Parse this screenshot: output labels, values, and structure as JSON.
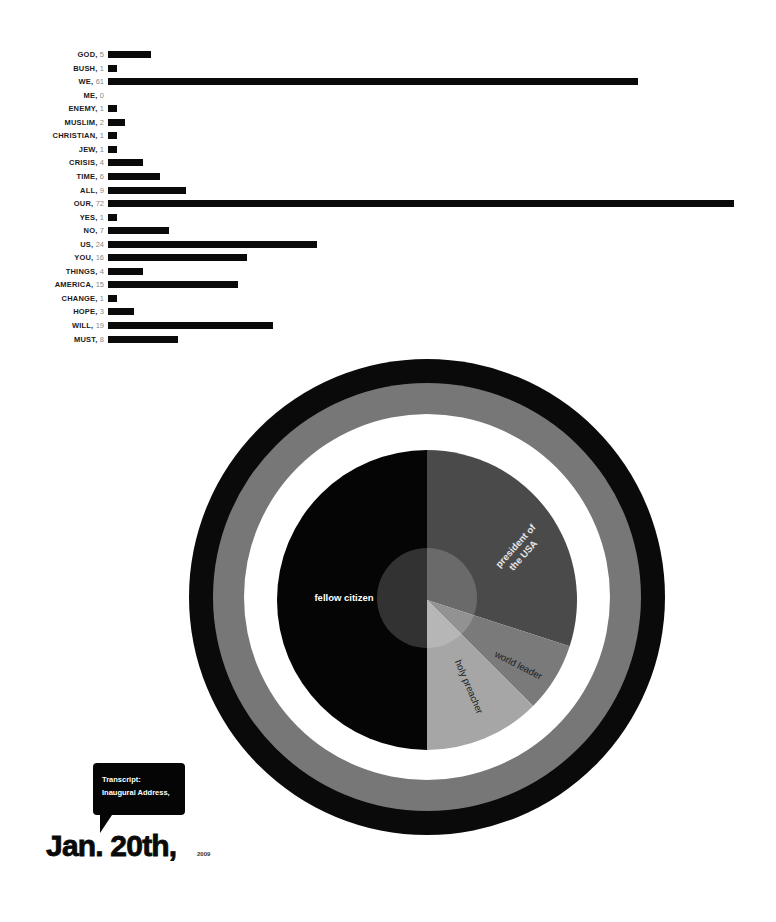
{
  "chart_data": [
    {
      "type": "bar",
      "orientation": "horizontal",
      "title": "",
      "xlabel": "",
      "ylabel": "",
      "grid": false,
      "legend": "none",
      "categories": [
        "GOD",
        "BUSH",
        "WE",
        "ME",
        "ENEMY",
        "MUSLIM",
        "CHRISTIAN",
        "JEW",
        "CRISIS",
        "TIME",
        "ALL",
        "OUR",
        "YES",
        "NO",
        "US",
        "YOU",
        "THINGS",
        "AMERICA",
        "CHANGE",
        "HOPE",
        "WILL",
        "MUST"
      ],
      "values": [
        5,
        1,
        61,
        0,
        1,
        2,
        1,
        1,
        4,
        6,
        9,
        72,
        1,
        7,
        24,
        16,
        4,
        15,
        1,
        3,
        19,
        8
      ],
      "xlim": [
        0,
        72
      ],
      "bar_color": "#0a0a0a"
    },
    {
      "type": "pie",
      "title": "",
      "legend": "none",
      "labels": [
        "president of the USA",
        "world leader",
        "holy preacher",
        "fellow citizen"
      ],
      "values": [
        30,
        7.5,
        12.5,
        50
      ],
      "colors": [
        "#4a4a4a",
        "#7a7a7a",
        "#a6a6a6",
        "#050505"
      ],
      "start_angle_deg": 0,
      "direction": "clockwise",
      "rings": [
        {
          "name": "outer-ring",
          "color": "#0a0a0a"
        },
        {
          "name": "middle-ring",
          "color": "#777777"
        },
        {
          "name": "inner-ring",
          "color": "#ffffff"
        }
      ]
    }
  ],
  "bar_rows": [
    {
      "word": "GOD",
      "count": "5"
    },
    {
      "word": "BUSH",
      "count": "1"
    },
    {
      "word": "WE",
      "count": "61"
    },
    {
      "word": "ME",
      "count": "0"
    },
    {
      "word": "ENEMY",
      "count": "1"
    },
    {
      "word": "MUSLIM",
      "count": "2"
    },
    {
      "word": "CHRISTIAN",
      "count": "1"
    },
    {
      "word": "JEW",
      "count": "1"
    },
    {
      "word": "CRISIS",
      "count": "4"
    },
    {
      "word": "TIME",
      "count": "6"
    },
    {
      "word": "ALL",
      "count": "9"
    },
    {
      "word": "OUR",
      "count": "72"
    },
    {
      "word": "YES",
      "count": "1"
    },
    {
      "word": "NO",
      "count": "7"
    },
    {
      "word": "US",
      "count": "24"
    },
    {
      "word": "YOU",
      "count": "16"
    },
    {
      "word": "THINGS",
      "count": "4"
    },
    {
      "word": "AMERICA",
      "count": "15"
    },
    {
      "word": "CHANGE",
      "count": "1"
    },
    {
      "word": "HOPE",
      "count": "3"
    },
    {
      "word": "WILL",
      "count": "19"
    },
    {
      "word": "MUST",
      "count": "8"
    }
  ],
  "pie_labels": {
    "president_line1": "president of",
    "president_line2": "the USA",
    "world_leader": "world leader",
    "holy_preacher": "holy preacher",
    "fellow_citizen": "fellow citizen"
  },
  "callout": {
    "line1": "Transcript:",
    "line2": "Inaugural Address,"
  },
  "date": {
    "main": "Jan. 20th,",
    "year": "2009"
  }
}
